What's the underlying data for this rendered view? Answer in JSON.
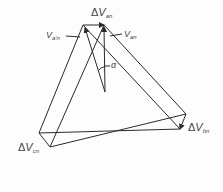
{
  "diagram": {
    "type": "phasor-diagram",
    "labels": {
      "delta_van": {
        "prefix": "Δ",
        "main": "V",
        "sub": "an"
      },
      "va_prime_n": {
        "main": "V",
        "sub": "a'n"
      },
      "van": {
        "main": "V",
        "sub": "an"
      },
      "alpha": "α",
      "delta_vbn": {
        "prefix": "Δ",
        "main": "V",
        "sub": "bn"
      },
      "delta_vcn": {
        "prefix": "Δ",
        "main": "V",
        "sub": "cn"
      }
    },
    "colors": {
      "line": "#2a2a2a",
      "text": "#444444",
      "background": "#fdfdfd"
    }
  }
}
